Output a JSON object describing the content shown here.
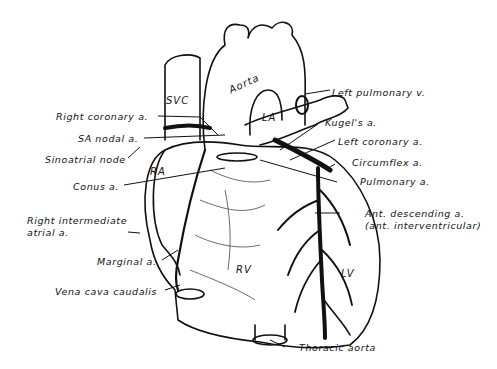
{
  "diagram": {
    "colors": {
      "ink": "#111111",
      "background": "#ffffff"
    },
    "internal_labels": {
      "aorta": "Aorta",
      "svc": "SVC",
      "la": "LA",
      "ra": "RA",
      "rv": "RV",
      "lv": "LV"
    },
    "left_labels": [
      {
        "id": "right-coronary",
        "text": "Right coronary a."
      },
      {
        "id": "sa-nodal",
        "text": "SA nodal a."
      },
      {
        "id": "sinoatrial-node",
        "text": "Sinoatrial node"
      },
      {
        "id": "conus",
        "text": "Conus a."
      },
      {
        "id": "right-intermediate-1",
        "text": "Right intermediate"
      },
      {
        "id": "right-intermediate-2",
        "text": "atrial a."
      },
      {
        "id": "marginal",
        "text": "Marginal a."
      },
      {
        "id": "vena-cava-caudalis",
        "text": "Vena cava caudalis"
      }
    ],
    "right_labels": [
      {
        "id": "left-pulmonary-v",
        "text": "Left pulmonary v."
      },
      {
        "id": "kugels",
        "text": "Kugel's a."
      },
      {
        "id": "left-coronary",
        "text": "Left coronary a."
      },
      {
        "id": "circumflex",
        "text": "Circumflex a."
      },
      {
        "id": "pulmonary",
        "text": "Pulmonary a."
      },
      {
        "id": "ant-descending-1",
        "text": "Ant. descending a."
      },
      {
        "id": "ant-descending-2",
        "text": "(ant. interventricular)"
      },
      {
        "id": "thoracic-aorta",
        "text": "Thoracic aorta"
      }
    ]
  }
}
